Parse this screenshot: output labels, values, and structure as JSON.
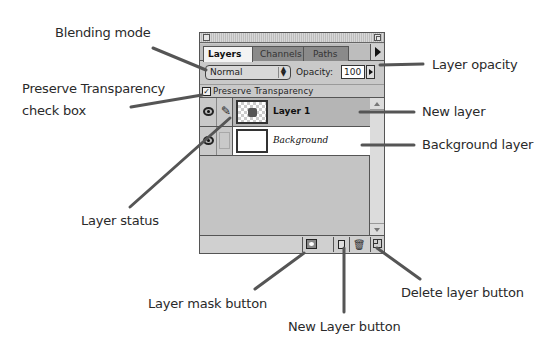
{
  "palette": {
    "tabs": [
      {
        "label": "Layers",
        "active": true
      },
      {
        "label": "Channels",
        "active": false
      },
      {
        "label": "Paths",
        "active": false
      }
    ],
    "blend_mode": "Normal",
    "opacity_label": "Opacity:",
    "opacity_value": "100",
    "preserve_transparency_label": "Preserve Transparency",
    "preserve_transparency_checked": "✓",
    "layers": [
      {
        "name": "Layer 1",
        "selected": true,
        "visible": true,
        "status": "paintbrush"
      },
      {
        "name": "Background",
        "selected": false,
        "visible": true,
        "status": "none"
      }
    ],
    "footer_buttons": [
      "layer-mask",
      "new-layer",
      "delete-layer"
    ],
    "icons": {
      "brush": "✎",
      "trash": "🗑",
      "select_arrows": "⬍"
    }
  },
  "callouts": {
    "blending_mode": "Blending mode",
    "preserve_transparency_line1": "Preserve Transparency",
    "preserve_transparency_line2": "check box",
    "layer_status": "Layer status",
    "layer_opacity": "Layer opacity",
    "new_layer": "New layer",
    "background_layer": "Background layer",
    "layer_mask_button": "Layer mask button",
    "new_layer_button": "New Layer button",
    "delete_layer_button": "Delete layer button"
  },
  "colors": {
    "leader_line": "#555555",
    "palette_bg": "#c9c9c9",
    "selected_row": "#b5b5b5",
    "tab_inactive": "#8a8a8a"
  }
}
